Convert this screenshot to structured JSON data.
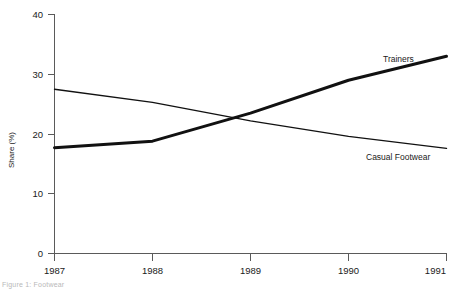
{
  "chart_data": {
    "type": "line",
    "title": "",
    "xlabel": "",
    "ylabel": "Share (%)",
    "x": [
      "1987",
      "1988",
      "1989",
      "1990",
      "1991"
    ],
    "xlim": [
      1987,
      1991
    ],
    "ylim": [
      0,
      40
    ],
    "yticks": [
      "0",
      "10",
      "20",
      "30",
      "40"
    ],
    "grid": false,
    "legend_position": "inline-annotation",
    "series": [
      {
        "name": "Trainers",
        "values": [
          17.7,
          18.8,
          23.5,
          29.0,
          33.0
        ],
        "color": "#111111",
        "line_width": 3.0
      },
      {
        "name": "Casual Footwear",
        "values": [
          27.5,
          25.3,
          22.2,
          19.6,
          17.6
        ],
        "color": "#111111",
        "line_width": 1.4
      }
    ],
    "annotations": [
      {
        "text": "Trainers",
        "x": 1990.0,
        "y": 32.0
      },
      {
        "text": "Casual Footwear",
        "x": 1990.1,
        "y": 16.0
      }
    ]
  },
  "axes": {
    "y_title": "Share (%)",
    "y_tick_labels": [
      "40",
      "30",
      "20",
      "10",
      "0"
    ],
    "x_tick_labels": [
      "1987",
      "1988",
      "1989",
      "1990",
      "1991"
    ]
  },
  "labels": {
    "trainers": "Trainers",
    "casual_footwear": "Casual Footwear"
  },
  "footer": {
    "note": "Figure 1: Footwear"
  }
}
